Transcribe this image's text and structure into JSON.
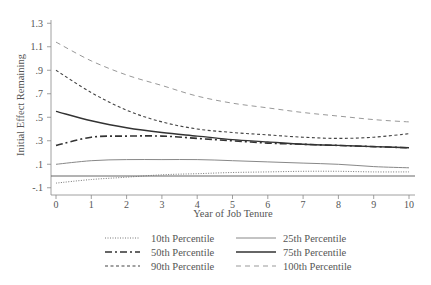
{
  "chart_data": {
    "type": "line",
    "title": "",
    "xlabel": "Year of Job Tenure",
    "ylabel": "Initial Effect Remaining",
    "xlim": [
      0,
      10
    ],
    "ylim": [
      -0.15,
      1.32
    ],
    "x_ticks": [
      0,
      1,
      2,
      3,
      4,
      5,
      6,
      7,
      8,
      9,
      10
    ],
    "x_tick_labels": [
      "0",
      "1",
      "2",
      "3",
      "4",
      "5",
      "6",
      "7",
      "8",
      "9",
      "10"
    ],
    "y_ticks": [
      -0.1,
      0.1,
      0.3,
      0.5,
      0.7,
      0.9,
      1.1,
      1.3
    ],
    "y_tick_labels": [
      "-.1",
      ".1",
      ".3",
      ".5",
      ".7",
      ".9",
      "1.1",
      "1.3"
    ],
    "grid": false,
    "legend_position": "bottom",
    "reference_line": {
      "y": 0,
      "style": "solid"
    },
    "x": [
      0,
      1,
      2,
      3,
      4,
      5,
      6,
      7,
      8,
      9,
      10
    ],
    "series": [
      {
        "name": "10th Percentile",
        "style": "dotted",
        "values": [
          -0.06,
          -0.03,
          -0.01,
          0.01,
          0.02,
          0.03,
          0.035,
          0.04,
          0.04,
          0.035,
          0.035
        ]
      },
      {
        "name": "25th Percentile",
        "style": "solid-thin",
        "values": [
          0.1,
          0.13,
          0.14,
          0.14,
          0.14,
          0.13,
          0.12,
          0.11,
          0.1,
          0.08,
          0.07
        ]
      },
      {
        "name": "50th Percentile",
        "style": "dash-dot",
        "values": [
          0.26,
          0.33,
          0.34,
          0.34,
          0.32,
          0.3,
          0.28,
          0.27,
          0.26,
          0.25,
          0.24
        ]
      },
      {
        "name": "75th Percentile",
        "style": "solid-thick",
        "values": [
          0.55,
          0.47,
          0.41,
          0.37,
          0.34,
          0.31,
          0.29,
          0.27,
          0.26,
          0.25,
          0.24
        ]
      },
      {
        "name": "90th Percentile",
        "style": "dashed",
        "values": [
          0.9,
          0.71,
          0.56,
          0.46,
          0.4,
          0.37,
          0.35,
          0.33,
          0.32,
          0.33,
          0.36
        ]
      },
      {
        "name": "100th Percentile",
        "style": "long-dash-light",
        "values": [
          1.14,
          0.98,
          0.86,
          0.77,
          0.68,
          0.62,
          0.58,
          0.54,
          0.51,
          0.48,
          0.46
        ]
      }
    ]
  },
  "legend": {
    "items": [
      {
        "label": "10th Percentile"
      },
      {
        "label": "25th Percentile"
      },
      {
        "label": "50th Percentile"
      },
      {
        "label": "75th Percentile"
      },
      {
        "label": "90th Percentile"
      },
      {
        "label": "100th Percentile"
      }
    ]
  },
  "axes": {
    "xlabel": "Year of Job Tenure",
    "ylabel": "Initial Effect Remaining"
  },
  "colors": {
    "axis": "#888888",
    "text": "#555555",
    "line_dark": "#333333",
    "line_mid": "#666666",
    "line_light": "#999999"
  }
}
